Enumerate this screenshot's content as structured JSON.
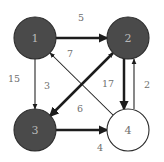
{
  "figure": {
    "kind": "directed-weighted-graph",
    "background_color": "#ffffff",
    "width": 164,
    "height": 162
  },
  "style": {
    "filled_node_fill": "#4a4a4a",
    "filled_node_stroke": "#2b2b2b",
    "filled_node_text": "#b9b9b9",
    "empty_node_fill": "#ffffff",
    "empty_node_stroke": "#2b2b2b",
    "empty_node_text": "#6e6e6e",
    "edge_color": "#1c1c1c",
    "weight_text_color": "#6e6e6e"
  },
  "nodes": [
    {
      "id": "1",
      "label": "1",
      "cx": 35,
      "cy": 38,
      "r": 21,
      "filled": true
    },
    {
      "id": "2",
      "label": "2",
      "cx": 128,
      "cy": 38,
      "r": 21,
      "filled": true
    },
    {
      "id": "3",
      "label": "3",
      "cx": 35,
      "cy": 130,
      "r": 21,
      "filled": true
    },
    {
      "id": "4",
      "label": "4",
      "cx": 128,
      "cy": 130,
      "r": 21,
      "filled": false
    }
  ],
  "edges": [
    {
      "id": "e1",
      "from": "1",
      "to": "2",
      "weight": "5",
      "weight_x": 81,
      "weight_y": 17,
      "thick": true,
      "x1": 56,
      "y1": 38,
      "x2": 107,
      "y2": 38
    },
    {
      "id": "e2",
      "from": "1",
      "to": "3",
      "weight": "15",
      "weight_x": 14,
      "weight_y": 78,
      "thick": false,
      "x1": 35,
      "y1": 59,
      "x2": 35,
      "y2": 109
    },
    {
      "id": "e3",
      "from": "2",
      "to": "3",
      "weight": "3",
      "weight_x": 47,
      "weight_y": 85,
      "thick": true,
      "x1": 113,
      "y1": 53,
      "x2": 50,
      "y2": 116
    },
    {
      "id": "e4",
      "from": "4",
      "to": "1",
      "weight": "7",
      "weight_x": 70,
      "weight_y": 53,
      "thick": false,
      "x1": 113,
      "y1": 115,
      "x2": 50,
      "y2": 53
    },
    {
      "id": "e5",
      "from": "3",
      "to": "2",
      "weight": "6",
      "weight_x": 80,
      "weight_y": 108,
      "thick": false,
      "x1": 50,
      "y1": 116,
      "x2": 113,
      "y2": 53
    },
    {
      "id": "e6",
      "from": "2",
      "to": "4",
      "weight": "17",
      "weight_x": 108,
      "weight_y": 83,
      "thick": true,
      "x1": 124,
      "y1": 59,
      "x2": 124,
      "y2": 109
    },
    {
      "id": "e7",
      "from": "4",
      "to": "2",
      "weight": "2",
      "weight_x": 147,
      "weight_y": 84,
      "thick": false,
      "x1": 134,
      "y1": 109,
      "x2": 134,
      "y2": 59
    },
    {
      "id": "e8",
      "from": "3",
      "to": "4",
      "weight": "4",
      "weight_x": 100,
      "weight_y": 147,
      "thick": true,
      "x1": 56,
      "y1": 130,
      "x2": 107,
      "y2": 130
    }
  ],
  "graph_summary": {
    "node_count": 4,
    "edge_count": 8,
    "weights": [
      "5",
      "15",
      "3",
      "7",
      "6",
      "17",
      "2",
      "4"
    ]
  }
}
